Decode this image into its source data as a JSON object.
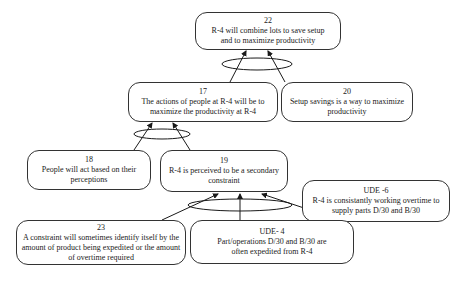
{
  "diagram": {
    "type": "current-reality-tree",
    "nodes": [
      {
        "id": "22",
        "label": "22",
        "text": "R-4 will combine lots to save setup  and to maximize productivity"
      },
      {
        "id": "17",
        "label": "17",
        "text": "The actions of people  at R-4 will be to maximize the productivity at R-4"
      },
      {
        "id": "20",
        "label": "20",
        "text": "Setup savings is a way to maximize productivity"
      },
      {
        "id": "18",
        "label": "18",
        "text": "People will act based on their perceptions"
      },
      {
        "id": "19",
        "label": "19",
        "text": "R-4 is perceived to be a secondary constraint"
      },
      {
        "id": "UDE-6",
        "label": "UDE -6",
        "text": "R-4 is  consistantly working overtime to supply parts D/30  and B/30"
      },
      {
        "id": "23",
        "label": "23",
        "text": "A constraint will sometimes  identify itself by the amount of product being expedited or the amount of overtime required"
      },
      {
        "id": "UDE-4",
        "label": "UDE- 4",
        "text": "Part/operations D/30 and B/30 are often expedited from R-4"
      }
    ],
    "edges": [
      {
        "from": "17",
        "to": "22",
        "and_group": "A"
      },
      {
        "from": "20",
        "to": "22",
        "and_group": "A"
      },
      {
        "from": "18",
        "to": "17",
        "and_group": "B"
      },
      {
        "from": "19",
        "to": "17",
        "and_group": "B"
      },
      {
        "from": "23",
        "to": "19",
        "and_group": "C"
      },
      {
        "from": "UDE-4",
        "to": "19",
        "and_group": "C"
      },
      {
        "from": "UDE-6",
        "to": "19",
        "and_group": "C"
      }
    ]
  }
}
